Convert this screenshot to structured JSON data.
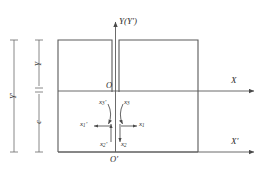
{
  "figure": {
    "type": "technical-line-diagram",
    "background_color": "#ffffff",
    "line_color": "#4a4a4a",
    "text_color": "#2b2b2b"
  },
  "axes": {
    "vertical": {
      "label": "Y(Y′)",
      "name": "y-axis"
    },
    "horizontal_upper": {
      "label": "X",
      "name": "x-axis"
    },
    "horizontal_lower": {
      "label": "X′",
      "name": "x-prime-axis"
    }
  },
  "origins": {
    "upper": "O",
    "lower": "O′"
  },
  "dimensions": {
    "outer": {
      "label": "Y′",
      "description": "full-height dimension bar"
    },
    "inner_upper": {
      "label": "Y",
      "description": "upper dimension segment"
    },
    "inner_lower": {
      "label": "c",
      "description": "lower dimension segment"
    }
  },
  "displacements": [
    {
      "label_base": "x",
      "subscript": "1",
      "primed": true,
      "text": "x₁′",
      "direction": "left",
      "name": "x1-prime"
    },
    {
      "label_base": "x",
      "subscript": "1",
      "primed": false,
      "text": "x₁",
      "direction": "right",
      "name": "x1"
    },
    {
      "label_base": "x",
      "subscript": "2",
      "primed": true,
      "text": "x₂′",
      "direction": "up",
      "name": "x2-prime"
    },
    {
      "label_base": "x",
      "subscript": "2",
      "primed": false,
      "text": "x₂",
      "direction": "down",
      "name": "x2"
    },
    {
      "label_base": "x",
      "subscript": "3",
      "primed": true,
      "text": "x₃′",
      "direction": "rotation-left",
      "name": "x3-prime"
    },
    {
      "label_base": "x",
      "subscript": "3",
      "primed": false,
      "text": "x₃",
      "direction": "rotation-right",
      "name": "x3"
    }
  ],
  "labels": {
    "y_axis": "Y(Y′)",
    "x_axis": "X",
    "x_prime_axis": "X′",
    "origin_upper": "O",
    "origin_lower": "O′",
    "dim_outer": "Y′",
    "dim_inner_upper": "Y",
    "dim_inner_lower": "c",
    "x1_prime_base": "x",
    "x1_prime_sub": "1",
    "x1_prime_mark": "′",
    "x1_base": "x",
    "x1_sub": "1",
    "x2_prime_base": "x",
    "x2_prime_sub": "2",
    "x2_prime_mark": "′",
    "x2_base": "x",
    "x2_sub": "2",
    "x3_prime_base": "x",
    "x3_prime_sub": "3",
    "x3_prime_mark": "′",
    "x3_base": "x",
    "x3_sub": "3"
  }
}
